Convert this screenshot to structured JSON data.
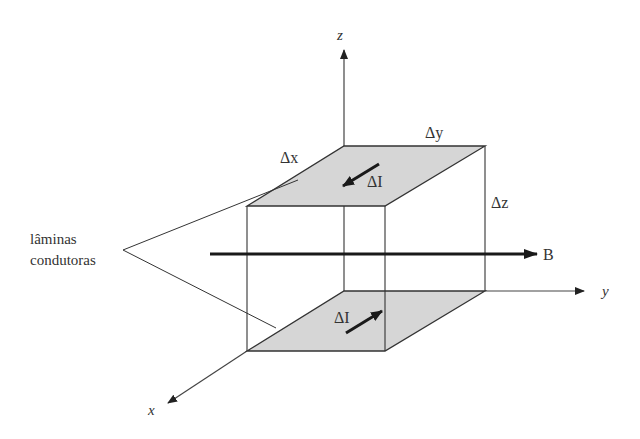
{
  "diagram": {
    "axes": {
      "z": "z",
      "y": "y",
      "x": "x"
    },
    "dimensions": {
      "dx": "Δx",
      "dy": "Δy",
      "dz": "Δz"
    },
    "currents": {
      "top": "ΔI",
      "bottom": "ΔI"
    },
    "field": "B",
    "callout": {
      "line1": "lâminas",
      "line2": "condutoras"
    },
    "colors": {
      "plate_fill": "#d6d6d6",
      "line": "#333333",
      "arrow": "#1a1a1a"
    }
  }
}
